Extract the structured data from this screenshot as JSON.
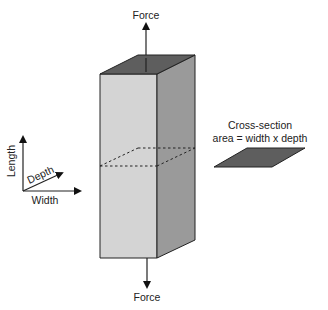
{
  "diagram": {
    "top_force_label": "Force",
    "bottom_force_label": "Force",
    "axes": {
      "length_label": "Length",
      "depth_label": "Depth",
      "width_label": "Width"
    },
    "cross_section": {
      "title": "Cross-section",
      "formula": "area = width x depth"
    },
    "colors": {
      "front_face": "#d4d4d4",
      "side_face": "#9a9a9a",
      "top_face": "#5e5e5e",
      "cross_section_fill": "#5e5e5e",
      "stroke": "#222222"
    }
  }
}
